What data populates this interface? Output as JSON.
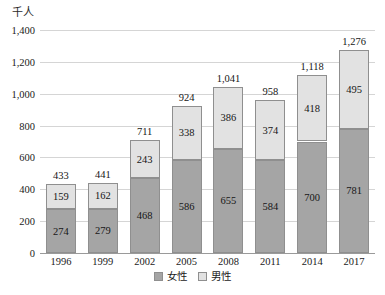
{
  "chart_data": {
    "type": "bar",
    "stacked": true,
    "title": "",
    "subtitle": "",
    "xlabel": "",
    "ylabel": "千人",
    "unit_label": "千人",
    "categories": [
      "1996",
      "1999",
      "2002",
      "2005",
      "2008",
      "2011",
      "2014",
      "2017"
    ],
    "series": [
      {
        "name": "女性",
        "color": "#a5a5a5",
        "values": [
          274,
          279,
          468,
          586,
          655,
          584,
          700,
          781
        ]
      },
      {
        "name": "男性",
        "color": "#e2e2e2",
        "values": [
          159,
          162,
          243,
          338,
          386,
          374,
          418,
          495
        ]
      }
    ],
    "totals": [
      433,
      441,
      711,
      924,
      1041,
      958,
      1118,
      1276
    ],
    "total_labels": [
      "433",
      "441",
      "711",
      "924",
      "1,041",
      "958",
      "1,118",
      "1,276"
    ],
    "ylim": [
      0,
      1400
    ],
    "ytick_values": [
      0,
      200,
      400,
      600,
      800,
      1000,
      1200,
      1400
    ],
    "ytick_labels": [
      "0",
      "200",
      "400",
      "600",
      "800",
      "1,000",
      "1,200",
      "1,400"
    ],
    "grid": true,
    "legend_position": "bottom"
  },
  "legend": {
    "items": [
      {
        "label": "女性",
        "swatch": "female-swatch"
      },
      {
        "label": "男性",
        "swatch": "male-swatch"
      }
    ]
  }
}
